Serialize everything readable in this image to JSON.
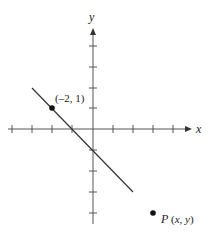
{
  "diagram": {
    "type": "coordinate-plane",
    "axes": {
      "x_label": "x",
      "y_label": "y",
      "x_ticks": [
        -4,
        -3,
        -2,
        -1,
        1,
        2,
        3,
        4
      ],
      "y_ticks": [
        4,
        3,
        2,
        1,
        -1,
        -2,
        -3,
        -4
      ],
      "color": "#555555"
    },
    "line": {
      "description": "line through (-2, 1) and (0, -1)",
      "from": [
        -3,
        2
      ],
      "to": [
        2,
        -3
      ],
      "color": "#333333"
    },
    "points": [
      {
        "name": "given-point",
        "label": "(–2, 1)",
        "coords": [
          -2,
          1
        ]
      },
      {
        "name": "point-p",
        "label_main": "P",
        "label_coords": "(x, y)"
      }
    ]
  },
  "labels": {
    "x_axis": "x",
    "y_axis": "y",
    "point_given": "(–2, 1)",
    "point_p_name": "P",
    "point_p_coords": "(x, y)"
  }
}
